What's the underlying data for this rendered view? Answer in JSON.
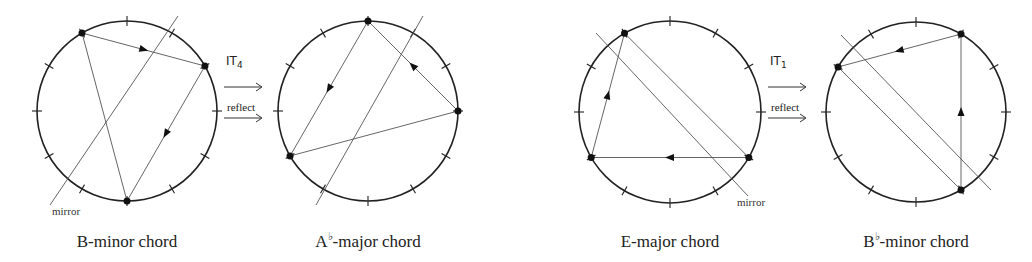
{
  "diagrams": [
    {
      "id": "b-minor",
      "caption_root": "B",
      "caption_accidental": "",
      "caption_rest": "-minor chord",
      "cx": 127,
      "cy": 111,
      "r": 90,
      "pitch_classes": [
        11,
        2,
        6
      ],
      "arrows": [
        [
          11,
          2
        ],
        [
          2,
          6
        ]
      ],
      "mirror": [
        50,
        205,
        178,
        16
      ],
      "mirror_label": "mirror",
      "mirror_label_pos": [
        52,
        205
      ]
    },
    {
      "id": "ab-major",
      "caption_root": "A",
      "caption_accidental": "♭",
      "caption_rest": "-major chord",
      "cx": 368,
      "cy": 111,
      "r": 90,
      "pitch_classes": [
        0,
        3,
        8
      ],
      "arrows": [
        [
          3,
          0
        ],
        [
          0,
          8
        ]
      ],
      "mirror": [
        316,
        205,
        423,
        16
      ]
    },
    {
      "id": "e-major",
      "caption_root": "E",
      "caption_accidental": "",
      "caption_rest": "-major chord",
      "cx": 670,
      "cy": 112,
      "r": 91,
      "pitch_classes": [
        4,
        8,
        11
      ],
      "arrows": [
        [
          4,
          8
        ],
        [
          8,
          11
        ]
      ],
      "mirror": [
        596,
        33,
        748,
        196
      ],
      "mirror_label": "mirror",
      "mirror_label_pos": [
        737,
        196
      ]
    },
    {
      "id": "bb-minor",
      "caption_root": "B",
      "caption_accidental": "♭",
      "caption_rest": "-minor chord",
      "cx": 916,
      "cy": 112,
      "r": 90,
      "pitch_classes": [
        10,
        1,
        5
      ],
      "arrows": [
        [
          5,
          1
        ],
        [
          1,
          10
        ]
      ],
      "mirror": [
        841,
        35,
        991,
        190
      ]
    }
  ],
  "operations": [
    {
      "id": "op-1",
      "transform": "IT",
      "subscript": "4",
      "reflect": "reflect",
      "x": 224,
      "y_it": 70,
      "y_ref": 118
    },
    {
      "id": "op-2",
      "transform": "IT",
      "subscript": "1",
      "reflect": "reflect",
      "x": 768,
      "y_it": 70,
      "y_ref": 118
    }
  ],
  "colors": {
    "stroke": "#222222",
    "line": "#555555"
  }
}
